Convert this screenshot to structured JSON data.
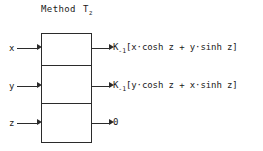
{
  "diagram": {
    "title": {
      "method_word": "Method",
      "operator_base": "T",
      "operator_subscript": "z",
      "full_text": "Method T_z"
    },
    "block": {
      "segment_count": 3,
      "border_color": "#2b2b2b",
      "fill_color": "#ffffff"
    },
    "rows": [
      {
        "input_label": "x",
        "output_base": "K",
        "output_subscript": "-1",
        "output_expression": "[x·cosh z + y·sinh z]",
        "output_full": "K_-1[x·cosh z + y·sinh z]"
      },
      {
        "input_label": "y",
        "output_base": "K",
        "output_subscript": "-1",
        "output_expression": "[y·cosh z + x·sinh z]",
        "output_full": "K_-1[y·cosh z + x·sinh z]"
      },
      {
        "input_label": "z",
        "output_base": "",
        "output_subscript": "",
        "output_expression": "0",
        "output_full": "0"
      }
    ]
  }
}
